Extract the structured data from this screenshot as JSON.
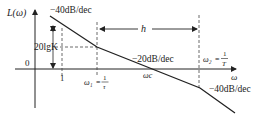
{
  "diagram": {
    "y_axis_label": "L(ω)",
    "x_axis_label": "ω",
    "origin_label": "0",
    "slopes": {
      "first": "−40dB/dec",
      "second": "−20dB/dec",
      "third": "−40dB/dec"
    },
    "gain_label": "20lgK",
    "tick_one": "1",
    "omega1": {
      "name": "ω₁",
      "eq": "=",
      "num": "1",
      "den": "τ"
    },
    "omega_c": "ωc",
    "omega2": {
      "name": "ω₂",
      "eq": "=",
      "num": "1",
      "den": "T"
    },
    "width_label": "h",
    "colors": {
      "line": "#222222",
      "dash": "#444444",
      "background": "#ffffff"
    }
  }
}
